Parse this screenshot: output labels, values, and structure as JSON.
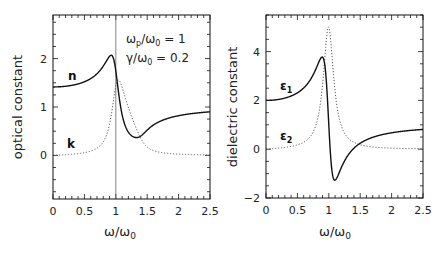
{
  "chart_data": [
    {
      "type": "line",
      "title": "",
      "xlabel": "ω/ω0",
      "ylabel": "optical constant",
      "xlim": [
        0,
        2.5
      ],
      "ylim": [
        -0.9,
        2.9
      ],
      "xticks": [
        0,
        0.5,
        1,
        1.5,
        2,
        2.5
      ],
      "xtick_labels": [
        "0",
        "0.5",
        "1",
        "1.5",
        "2",
        "2.5"
      ],
      "yticks": [
        0,
        1,
        2
      ],
      "ytick_labels": [
        "0",
        "1",
        "2"
      ],
      "grid": false,
      "vline": 1,
      "annotations": [
        "ωp/ω0 = 1",
        "γ/ω0 = 0.2"
      ],
      "x": [
        0,
        0.5,
        0.8,
        0.9,
        1.0,
        1.1,
        1.2,
        1.5,
        2.0,
        2.5
      ],
      "series": [
        {
          "name": "n",
          "style": "solid",
          "values": [
            1.41,
            1.52,
            1.84,
            2.05,
            1.75,
            0.84,
            0.49,
            0.52,
            0.82,
            0.9
          ]
        },
        {
          "name": "k",
          "style": "dotted",
          "values": [
            0.0,
            0.06,
            0.28,
            0.64,
            1.43,
            1.41,
            0.99,
            0.18,
            0.03,
            0.01
          ]
        }
      ]
    },
    {
      "type": "line",
      "title": "",
      "xlabel": "ω/ω0",
      "ylabel": "dielectric constant",
      "xlim": [
        0,
        2.5
      ],
      "ylim": [
        -2,
        5.5
      ],
      "xticks": [
        0,
        0.5,
        1,
        1.5,
        2,
        2.5
      ],
      "xtick_labels": [
        "0",
        "0.5",
        "1",
        "1.5",
        "2",
        "2.5"
      ],
      "yticks": [
        -2,
        0,
        2,
        4
      ],
      "ytick_labels": [
        "−2",
        "0",
        "2",
        "4"
      ],
      "grid": false,
      "x": [
        0,
        0.5,
        0.8,
        0.9,
        1.0,
        1.1,
        1.2,
        1.5,
        2.0,
        2.5
      ],
      "series": [
        {
          "name": "ε1",
          "style": "solid",
          "values": [
            2.0,
            2.31,
            3.32,
            3.77,
            1.0,
            -1.27,
            -0.75,
            0.24,
            0.67,
            0.81
          ]
        },
        {
          "name": "ε2",
          "style": "dotted",
          "values": [
            0.0,
            0.17,
            1.03,
            2.63,
            5.0,
            2.38,
            0.96,
            0.18,
            0.04,
            0.02
          ]
        }
      ]
    }
  ],
  "model": {
    "wp_over_w0": 1,
    "gamma_over_w0": 0.2
  },
  "left": {
    "ylabel": "optical constant",
    "xlabel_main": "ω/ω",
    "xlabel_sub": "0",
    "annot1_pre": "ω",
    "annot1_sub": "p",
    "annot1_mid": "/ω",
    "annot1_sub2": "0",
    "annot1_post": " = 1",
    "annot2_pre": "γ/ω",
    "annot2_sub": "0",
    "annot2_post": " = 0.2",
    "label_n": "n",
    "label_k": "k"
  },
  "right": {
    "ylabel": "dielectric constant",
    "xlabel_main": "ω/ω",
    "xlabel_sub": "0",
    "label_e1": "ε",
    "label_e1_sub": "1",
    "label_e2": "ε",
    "label_e2_sub": "2"
  }
}
